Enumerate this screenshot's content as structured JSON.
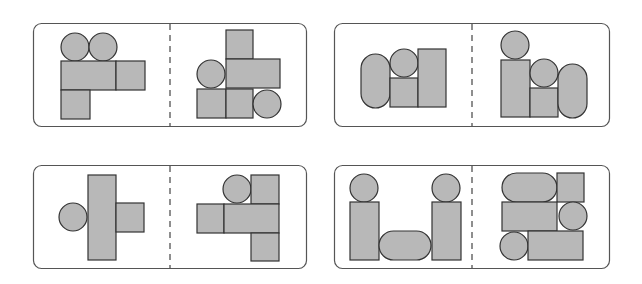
{
  "style": {
    "background": "#ffffff",
    "panel_stroke": "#555555",
    "shape_fill": "#b8b8b8",
    "shape_stroke": "#333333",
    "divider_stroke": "#444444"
  },
  "panels": [
    {
      "id": "top-left",
      "box": {
        "x": 33,
        "y": 23,
        "w": 273,
        "h": 103,
        "r": 8
      },
      "divider_x": 170,
      "left_shapes": [
        {
          "type": "circle",
          "cx": 75,
          "cy": 47,
          "r": 14
        },
        {
          "type": "circle",
          "cx": 103,
          "cy": 47,
          "r": 14
        },
        {
          "type": "rect",
          "x": 61,
          "y": 61,
          "w": 55,
          "h": 29
        },
        {
          "type": "rect",
          "x": 116,
          "y": 61,
          "w": 29,
          "h": 29
        },
        {
          "type": "rect",
          "x": 61,
          "y": 90,
          "w": 29,
          "h": 29
        }
      ],
      "right_shapes": [
        {
          "type": "rect",
          "x": 226,
          "y": 30,
          "w": 27,
          "h": 29
        },
        {
          "type": "rect",
          "x": 226,
          "y": 59,
          "w": 54,
          "h": 29
        },
        {
          "type": "circle",
          "cx": 211,
          "cy": 74,
          "r": 14
        },
        {
          "type": "rect",
          "x": 197,
          "y": 89,
          "w": 29,
          "h": 29
        },
        {
          "type": "rect",
          "x": 226,
          "y": 89,
          "w": 27,
          "h": 29
        },
        {
          "type": "circle",
          "cx": 267,
          "cy": 104,
          "r": 14
        }
      ]
    },
    {
      "id": "top-right",
      "box": {
        "x": 334,
        "y": 23,
        "w": 275,
        "h": 103,
        "r": 8
      },
      "divider_x": 472,
      "left_shapes": [
        {
          "type": "stadium",
          "x": 361,
          "y": 54,
          "w": 29,
          "h": 54
        },
        {
          "type": "circle",
          "cx": 404,
          "cy": 63,
          "r": 14
        },
        {
          "type": "rect",
          "x": 390,
          "y": 78,
          "w": 28,
          "h": 29
        },
        {
          "type": "rect",
          "x": 418,
          "y": 49,
          "w": 28,
          "h": 58
        }
      ],
      "right_shapes": [
        {
          "type": "circle",
          "cx": 515,
          "cy": 45,
          "r": 14
        },
        {
          "type": "rect",
          "x": 501,
          "y": 60,
          "w": 29,
          "h": 57
        },
        {
          "type": "circle",
          "cx": 544,
          "cy": 73,
          "r": 14
        },
        {
          "type": "rect",
          "x": 530,
          "y": 88,
          "w": 28,
          "h": 29
        },
        {
          "type": "stadium",
          "x": 558,
          "y": 64,
          "w": 29,
          "h": 54
        }
      ]
    },
    {
      "id": "bottom-left",
      "box": {
        "x": 33,
        "y": 165,
        "w": 273,
        "h": 103,
        "r": 8
      },
      "divider_x": 170,
      "left_shapes": [
        {
          "type": "rect",
          "x": 88,
          "y": 175,
          "w": 28,
          "h": 85
        },
        {
          "type": "rect",
          "x": 116,
          "y": 203,
          "w": 28,
          "h": 29
        },
        {
          "type": "circle",
          "cx": 73,
          "cy": 217,
          "r": 14
        }
      ],
      "right_shapes": [
        {
          "type": "circle",
          "cx": 237,
          "cy": 189,
          "r": 14
        },
        {
          "type": "rect",
          "x": 251,
          "y": 175,
          "w": 28,
          "h": 29
        },
        {
          "type": "rect",
          "x": 197,
          "y": 204,
          "w": 27,
          "h": 29
        },
        {
          "type": "rect",
          "x": 224,
          "y": 204,
          "w": 55,
          "h": 29
        },
        {
          "type": "rect",
          "x": 251,
          "y": 233,
          "w": 28,
          "h": 28
        }
      ]
    },
    {
      "id": "bottom-right",
      "box": {
        "x": 334,
        "y": 165,
        "w": 275,
        "h": 103,
        "r": 8
      },
      "divider_x": 472,
      "left_shapes": [
        {
          "type": "circle",
          "cx": 364,
          "cy": 188,
          "r": 14
        },
        {
          "type": "rect",
          "x": 350,
          "y": 202,
          "w": 29,
          "h": 58
        },
        {
          "type": "stadium",
          "x": 379,
          "y": 231,
          "w": 52,
          "h": 29
        },
        {
          "type": "circle",
          "cx": 446,
          "cy": 188,
          "r": 14
        },
        {
          "type": "rect",
          "x": 432,
          "y": 202,
          "w": 29,
          "h": 58
        }
      ],
      "right_shapes": [
        {
          "type": "stadium",
          "x": 502,
          "y": 173,
          "w": 55,
          "h": 29
        },
        {
          "type": "rect",
          "x": 557,
          "y": 173,
          "w": 27,
          "h": 29
        },
        {
          "type": "rect",
          "x": 502,
          "y": 202,
          "w": 55,
          "h": 29
        },
        {
          "type": "circle",
          "cx": 573,
          "cy": 216,
          "r": 14
        },
        {
          "type": "circle",
          "cx": 514,
          "cy": 246,
          "r": 14
        },
        {
          "type": "rect",
          "x": 528,
          "y": 231,
          "w": 55,
          "h": 29
        }
      ]
    }
  ]
}
